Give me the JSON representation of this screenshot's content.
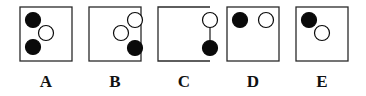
{
  "colors": {
    "stroke": "#2a2a2a",
    "filled": "#0a0a0a",
    "hollow": "#ffffff",
    "background": "#ffffff"
  },
  "box": {
    "width": 52,
    "height": 54,
    "top": 7
  },
  "circle_radius": 7.5,
  "options": [
    {
      "label": "A",
      "x": 20,
      "open_right": false,
      "circles": [
        {
          "cx": 13,
          "cy": 13,
          "fill": "black"
        },
        {
          "cx": 26,
          "cy": 26,
          "fill": "white"
        },
        {
          "cx": 13,
          "cy": 40,
          "fill": "black"
        }
      ]
    },
    {
      "label": "B",
      "x": 89,
      "open_right": false,
      "circles": [
        {
          "cx": 46,
          "cy": 13,
          "fill": "white"
        },
        {
          "cx": 32,
          "cy": 26,
          "fill": "white"
        },
        {
          "cx": 46,
          "cy": 41,
          "fill": "black"
        }
      ]
    },
    {
      "label": "C",
      "x": 158,
      "open_right": true,
      "circles": [
        {
          "cx": 52,
          "cy": 13,
          "fill": "white"
        },
        {
          "cx": 52,
          "cy": 41,
          "fill": "black"
        }
      ]
    },
    {
      "label": "D",
      "x": 227,
      "open_right": false,
      "circles": [
        {
          "cx": 13,
          "cy": 13,
          "fill": "black"
        },
        {
          "cx": 39,
          "cy": 13,
          "fill": "white"
        }
      ]
    },
    {
      "label": "E",
      "x": 296,
      "open_right": false,
      "circles": [
        {
          "cx": 13,
          "cy": 13,
          "fill": "black"
        },
        {
          "cx": 26,
          "cy": 26,
          "fill": "white"
        }
      ]
    }
  ],
  "label_y": 87
}
